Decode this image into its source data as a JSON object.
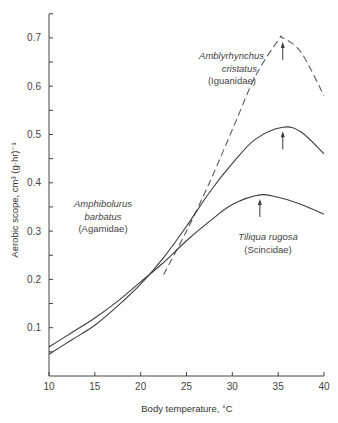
{
  "chart_data": {
    "type": "line",
    "title": "",
    "xlabel": "Body temperature, °C",
    "ylabel": "Aerobic scope, cm³ (g·hr)⁻¹",
    "xlim": [
      10,
      40
    ],
    "ylim": [
      0,
      0.75
    ],
    "xticks": [
      10,
      15,
      20,
      25,
      30,
      35,
      40
    ],
    "xtick_labels": [
      "10",
      "15",
      "20",
      "25",
      "30",
      "35",
      "40"
    ],
    "yticks": [
      0.1,
      0.2,
      0.3,
      0.4,
      0.5,
      0.6,
      0.7
    ],
    "ytick_labels": [
      "0.1",
      "0.2",
      "0.3",
      "0.4",
      "0.5",
      "0.6",
      "0.7"
    ],
    "grid": false,
    "legend": "none (inline annotations)",
    "series": [
      {
        "name": "Amblyrhynchus cristatus (Iguanidae)",
        "style": "dashed",
        "x": [
          22.5,
          25,
          27.5,
          30,
          32.5,
          35,
          35.5,
          37.5,
          40
        ],
        "y": [
          0.21,
          0.3,
          0.4,
          0.51,
          0.62,
          0.695,
          0.7,
          0.67,
          0.58
        ],
        "peak": {
          "x": 35.5,
          "y": 0.7
        }
      },
      {
        "name": "Amphibolurus barbatus (Agamidae)",
        "style": "solid",
        "x": [
          10,
          12.5,
          15,
          17.5,
          20,
          22.5,
          25,
          27.5,
          30,
          32.5,
          35.5,
          37.5,
          40
        ],
        "y": [
          0.045,
          0.075,
          0.105,
          0.145,
          0.19,
          0.245,
          0.31,
          0.38,
          0.44,
          0.49,
          0.515,
          0.505,
          0.46
        ],
        "peak": {
          "x": 35.5,
          "y": 0.515
        }
      },
      {
        "name": "Tiliqua rugosa (Scincidae)",
        "style": "solid",
        "x": [
          10,
          12.5,
          15,
          17.5,
          20,
          22.5,
          25,
          27.5,
          30,
          33,
          35,
          37.5,
          40
        ],
        "y": [
          0.06,
          0.09,
          0.12,
          0.155,
          0.195,
          0.235,
          0.28,
          0.32,
          0.355,
          0.375,
          0.37,
          0.355,
          0.335
        ],
        "peak": {
          "x": 33,
          "y": 0.375
        }
      }
    ],
    "annotations": [
      {
        "text": "Amblyrhynchus cristatus (Iguanidae)"
      },
      {
        "text": "Amphibolurus barbatus (Agamidae)"
      },
      {
        "text": "Tiliqua rugosa (Scincidae)"
      },
      {
        "text": "arrows mark peak aerobic scope for each species"
      }
    ]
  },
  "labels": {
    "xlabel": "Body temperature, °C",
    "ylabel": "Aerobic scope, cm³ (g·hr)⁻¹",
    "ambly_genus": "Amblyrhynchus",
    "ambly_species": "cristatus",
    "ambly_family": "(Iguanidae)",
    "amphi_genus": "Amphibolurus",
    "amphi_species": "barbatus",
    "amphi_family": "(Agamidae)",
    "tili_name": "Tiliqua rugosa",
    "tili_family": "(Scincidae)"
  },
  "colors": {
    "line": "#3c3c3c",
    "dashed": "#5a5a5a",
    "axis": "#444444"
  }
}
